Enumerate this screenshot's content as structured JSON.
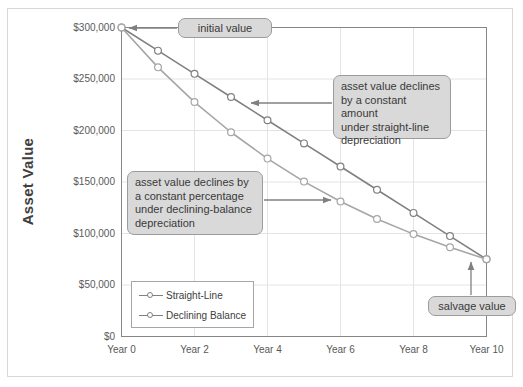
{
  "chart_data": {
    "type": "line",
    "title": "",
    "xlabel": "",
    "ylabel": "Asset Value",
    "x": [
      0,
      1,
      2,
      3,
      4,
      5,
      6,
      7,
      8,
      9,
      10
    ],
    "xtick_labels": [
      "Year 0",
      "Year 2",
      "Year 4",
      "Year 6",
      "Year 8",
      "Year 10"
    ],
    "xtick_values": [
      0,
      2,
      4,
      6,
      8,
      10
    ],
    "ytick_labels": [
      "$0",
      "$50,000",
      "$100,000",
      "$150,000",
      "$200,000",
      "$250,000",
      "$300,000"
    ],
    "ytick_values": [
      0,
      50000,
      100000,
      150000,
      200000,
      250000,
      300000
    ],
    "ylim": [
      0,
      300000
    ],
    "xlim": [
      0,
      10
    ],
    "grid": true,
    "legend_position": "lower-left-inside",
    "series": [
      {
        "name": "Straight-Line",
        "marker": "circle-open",
        "color": "#808080",
        "values": [
          300000,
          277500,
          255000,
          232500,
          210000,
          187500,
          165000,
          142500,
          120000,
          97500,
          75000
        ]
      },
      {
        "name": "Declining Balance",
        "marker": "circle-open",
        "color": "#a6a6a6",
        "values": [
          300000,
          261300,
          227600,
          198300,
          172700,
          150400,
          131000,
          114100,
          99400,
          86600,
          75000
        ]
      }
    ],
    "annotations": [
      {
        "name": "initial-value",
        "text": "initial value",
        "points_to": {
          "x": 0,
          "y": 300000
        }
      },
      {
        "name": "straight-line-note",
        "text": "asset value declines by a constant amount under straight-line depreciation",
        "lines": [
          "asset value declines",
          "by a constant amount",
          "under straight-line",
          "depreciation"
        ],
        "points_to": {
          "series": "Straight-Line",
          "x": 3,
          "y": 232500
        }
      },
      {
        "name": "declining-balance-note",
        "text": "asset value declines by a constant percentage under declining-balance depreciation",
        "lines": [
          "asset value declines by",
          "a constant percentage",
          "under declining-balance",
          "depreciation"
        ],
        "points_to": {
          "series": "Declining Balance",
          "x": 6,
          "y": 131000
        }
      },
      {
        "name": "salvage-value",
        "text": "salvage value",
        "points_to": {
          "x": 10,
          "y": 75000
        }
      }
    ]
  },
  "axis": {
    "y_title": "Asset Value"
  },
  "legend": {
    "items": [
      {
        "label": "Straight-Line"
      },
      {
        "label": "Declining Balance"
      }
    ]
  },
  "callouts": {
    "initial_value": "initial value",
    "salvage_value": "salvage value",
    "straight_line": {
      "l1": "asset value declines",
      "l2": "by a constant amount",
      "l3": "under straight-line",
      "l4": "depreciation"
    },
    "declining_balance": {
      "l1": "asset value declines by",
      "l2": "a constant percentage",
      "l3": "under declining-balance",
      "l4": "depreciation"
    }
  },
  "colors": {
    "series_straight_line": "#808080",
    "series_declining_balance": "#a6a6a6",
    "grid": "#e4e4e4",
    "axis": "#868686",
    "callout_fill": "#d9d9d9",
    "callout_border": "#9c9c9c",
    "text": "#595959"
  }
}
